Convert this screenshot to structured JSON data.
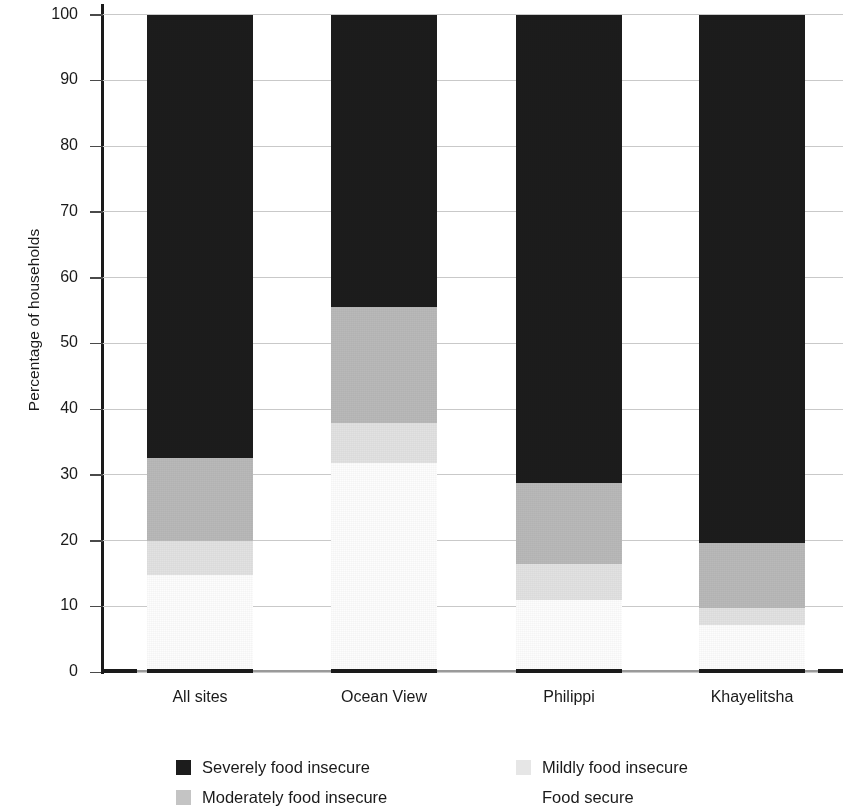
{
  "chart_data": {
    "type": "bar",
    "subtype": "stacked-bar-100",
    "title": "",
    "xlabel": "",
    "ylabel": "Percentage of households",
    "ylim": [
      0,
      100
    ],
    "yticks": [
      0,
      10,
      20,
      30,
      40,
      50,
      60,
      70,
      80,
      90,
      100
    ],
    "ytick_labels": [
      "0",
      "10",
      "20",
      "30",
      "40",
      "50",
      "60",
      "70",
      "80",
      "90",
      "100"
    ],
    "grid": true,
    "grid_axis": "y",
    "legend_position": "bottom",
    "categories": [
      "All sites",
      "Ocean View",
      "Philippi",
      "Khayelitsha"
    ],
    "series": [
      {
        "name": "Severely food insecure",
        "color": "#1c1c1c",
        "values": [
          67.5,
          44.4,
          71.2,
          80.4
        ]
      },
      {
        "name": "Moderately food insecure",
        "color": "#b9b9b9",
        "values": [
          12.5,
          17.7,
          12.3,
          9.9
        ]
      },
      {
        "name": "Mildly food insecure",
        "color": "#e2e2e2",
        "values": [
          5.2,
          6.1,
          5.5,
          2.5
        ]
      },
      {
        "name": "Food secure",
        "color": "#fdfdfd",
        "values": [
          14.8,
          31.8,
          11.0,
          7.2
        ]
      }
    ],
    "cumulative_tops": {
      "All sites": {
        "food_secure": 14.8,
        "mildly": 20.0,
        "moderately": 32.5,
        "severely": 100
      },
      "Ocean View": {
        "food_secure": 31.8,
        "mildly": 37.9,
        "moderately": 55.6,
        "severely": 100
      },
      "Philippi": {
        "food_secure": 11.0,
        "mildly": 16.5,
        "moderately": 28.8,
        "severely": 100
      },
      "Khayelitsha": {
        "food_secure": 7.2,
        "mildly": 9.7,
        "moderately": 19.6,
        "severely": 100
      }
    }
  },
  "axis": {
    "y_title": "Percentage of households",
    "y_ticks": [
      "100",
      "90",
      "80",
      "70",
      "60",
      "50",
      "40",
      "30",
      "20",
      "10",
      "0"
    ],
    "x_ticks": [
      "All sites",
      "Ocean View",
      "Philippi",
      "Khayelitsha"
    ]
  },
  "legend": {
    "items": [
      {
        "label": "Severely food insecure",
        "swatch": "severe"
      },
      {
        "label": "Mildly food insecure",
        "swatch": "mild"
      },
      {
        "label": "Moderately food insecure",
        "swatch": "moderate"
      },
      {
        "label": "Food secure",
        "swatch": "secure"
      }
    ]
  },
  "colors": {
    "severely": "#1c1c1c",
    "moderately": "#b9b9b9",
    "mildly": "#e2e2e2",
    "food_secure": "#fdfdfd",
    "gridline": "#c9c9c9",
    "axis": "#1a1a1a",
    "text": "#1a1a1a"
  }
}
